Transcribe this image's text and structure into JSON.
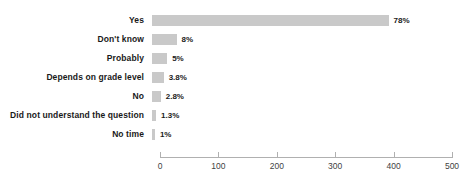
{
  "chart_data": {
    "type": "bar",
    "orientation": "horizontal",
    "title": "",
    "subtitle": "",
    "xlabel": "",
    "ylabel": "",
    "xlim": [
      0,
      500
    ],
    "xticks": [
      0,
      100,
      200,
      300,
      400,
      500
    ],
    "xtick_labels": [
      "0",
      "100",
      "200",
      "300",
      "400",
      "500"
    ],
    "grid": false,
    "legend": false,
    "bar_color": "#c9c9c9",
    "label_color": "#1a1a1a",
    "axis_color": "#b0b0b0",
    "categories": [
      "Yes",
      "Don't know",
      "Probably",
      "Depends on grade level",
      "No",
      "Did not understand the question",
      "No time"
    ],
    "values": [
      405,
      42,
      26,
      20,
      15,
      7,
      5
    ],
    "data_labels": [
      "78%",
      "8%",
      "5%",
      "3.8%",
      "2.8%",
      "1.3%",
      "1%"
    ],
    "percentages": [
      78,
      8,
      5,
      3.8,
      2.8,
      1.3,
      1
    ],
    "bars": [
      {
        "category": "Yes",
        "value": 405,
        "label": "78%"
      },
      {
        "category": "Don't know",
        "value": 42,
        "label": "8%"
      },
      {
        "category": "Probably",
        "value": 26,
        "label": "5%"
      },
      {
        "category": "Depends on grade level",
        "value": 20,
        "label": "3.8%"
      },
      {
        "category": "No",
        "value": 15,
        "label": "2.8%"
      },
      {
        "category": "Did not understand the question",
        "value": 7,
        "label": "1.3%"
      },
      {
        "category": "No time",
        "value": 5,
        "label": "1%"
      }
    ]
  }
}
